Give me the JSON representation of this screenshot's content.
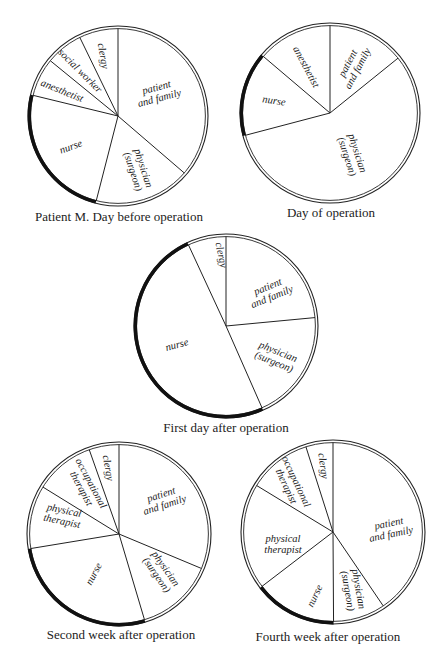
{
  "figure": {
    "highlight_slice": "nurse",
    "colors": {
      "background": "#ffffff",
      "stroke": "#222222",
      "highlight_arc": "#111111"
    }
  },
  "chart_data": [
    {
      "type": "pie",
      "title": "Patient M. Day before operation",
      "center": [
        118,
        116
      ],
      "radius": 90,
      "start_angle_deg": 0,
      "direction": "clockwise",
      "slices": [
        {
          "label": "patient and family",
          "lines": [
            "patient",
            "and family"
          ],
          "pct": 36.3,
          "label_pos": [
            158,
            93
          ],
          "rot": -15
        },
        {
          "label": "physician (surgeon)",
          "lines": [
            "physician",
            "(surgeon)"
          ],
          "pct": 17.7,
          "label_pos": [
            138,
            170
          ],
          "rot": 72
        },
        {
          "label": "nurse",
          "lines": [
            "nurse"
          ],
          "pct": 24.8,
          "label_pos": [
            71,
            147
          ],
          "rot": -20
        },
        {
          "label": "anesthetist",
          "lines": [
            "anesthetist"
          ],
          "pct": 7.1,
          "label_pos": [
            62,
            91
          ],
          "rot": 22
        },
        {
          "label": "social worker",
          "lines": [
            "social worker"
          ],
          "pct": 6.9,
          "label_pos": [
            80,
            71
          ],
          "rot": 45
        },
        {
          "label": "clergy",
          "lines": [
            "clergy"
          ],
          "pct": 7.2,
          "label_pos": [
            103,
            56
          ],
          "rot": 80
        }
      ]
    },
    {
      "type": "pie",
      "title": "Day of operation",
      "center": [
        330,
        113
      ],
      "radius": 90,
      "start_angle_deg": 0,
      "direction": "clockwise",
      "slices": [
        {
          "label": "patient and family",
          "lines": [
            "patient",
            "and family"
          ],
          "pct": 14.2,
          "label_pos": [
            353,
            66
          ],
          "rot": -62
        },
        {
          "label": "physician (surgeon)",
          "lines": [
            "physician",
            "(surgeon)"
          ],
          "pct": 56.7,
          "label_pos": [
            352,
            155
          ],
          "rot": 72
        },
        {
          "label": "nurse",
          "lines": [
            "nurse"
          ],
          "pct": 15.3,
          "label_pos": [
            274,
            101
          ],
          "rot": 8
        },
        {
          "label": "anesthetist",
          "lines": [
            "anesthetist"
          ],
          "pct": 13.8,
          "label_pos": [
            306,
            67
          ],
          "rot": 62
        }
      ]
    },
    {
      "type": "pie",
      "title": "First day after operation",
      "center": [
        226,
        326
      ],
      "radius": 92,
      "start_angle_deg": 0,
      "direction": "clockwise",
      "slices": [
        {
          "label": "patient and family",
          "lines": [
            "patient",
            "and family"
          ],
          "pct": 23.5,
          "label_pos": [
            270,
            292
          ],
          "rot": -22
        },
        {
          "label": "physician (surgeon)",
          "lines": [
            "physician",
            "(surgeon)"
          ],
          "pct": 19.9,
          "label_pos": [
            276,
            357
          ],
          "rot": 22
        },
        {
          "label": "nurse",
          "lines": [
            "nurse"
          ],
          "pct": 49.7,
          "label_pos": [
            177,
            345
          ],
          "rot": -15
        },
        {
          "label": "clergy",
          "lines": [
            "clergy"
          ],
          "pct": 6.9,
          "label_pos": [
            221,
            255
          ],
          "rot": 78
        }
      ]
    },
    {
      "type": "pie",
      "title": "Second week after operation",
      "center": [
        119,
        534
      ],
      "radius": 92,
      "start_angle_deg": 0,
      "direction": "clockwise",
      "slices": [
        {
          "label": "patient and family",
          "lines": [
            "patient",
            "and family"
          ],
          "pct": 31.3,
          "label_pos": [
            163,
            500
          ],
          "rot": -18
        },
        {
          "label": "physician (surgeon)",
          "lines": [
            "physician",
            "(surgeon)"
          ],
          "pct": 14.1,
          "label_pos": [
            161,
            572
          ],
          "rot": 55
        },
        {
          "label": "nurse",
          "lines": [
            "nurse"
          ],
          "pct": 27.0,
          "label_pos": [
            94,
            574
          ],
          "rot": -62
        },
        {
          "label": "physical therapist",
          "lines": [
            "physical",
            "therapist"
          ],
          "pct": 11.4,
          "label_pos": [
            63,
            516
          ],
          "rot": 12
        },
        {
          "label": "occupational therapist",
          "lines": [
            "occupational",
            "therapist"
          ],
          "pct": 10.8,
          "label_pos": [
            86,
            486
          ],
          "rot": 62
        },
        {
          "label": "clergy",
          "lines": [
            "clergy"
          ],
          "pct": 5.5,
          "label_pos": [
            108,
            468
          ],
          "rot": 80
        }
      ]
    },
    {
      "type": "pie",
      "title": "Fourth week after operation",
      "center": [
        333,
        532
      ],
      "radius": 92,
      "start_angle_deg": 0,
      "direction": "clockwise",
      "slices": [
        {
          "label": "patient and family",
          "lines": [
            "patient",
            "and family"
          ],
          "pct": 40.5,
          "label_pos": [
            390,
            529
          ],
          "rot": -12
        },
        {
          "label": "physician (surgeon)",
          "lines": [
            "physician",
            "(surgeon)"
          ],
          "pct": 9.4,
          "label_pos": [
            353,
            590
          ],
          "rot": 80
        },
        {
          "label": "nurse",
          "lines": [
            "nurse"
          ],
          "pct": 14.7,
          "label_pos": [
            315,
            596
          ],
          "rot": -65
        },
        {
          "label": "physical therapist",
          "lines": [
            "physical",
            "therapist"
          ],
          "pct": 19.1,
          "label_pos": [
            283,
            544
          ],
          "rot": 0
        },
        {
          "label": "occupational therapist",
          "lines": [
            "occupational",
            "therapist"
          ],
          "pct": 11.4,
          "label_pos": [
            291,
            484
          ],
          "rot": 65
        },
        {
          "label": "clergy",
          "lines": [
            "clergy"
          ],
          "pct": 4.9,
          "label_pos": [
            323,
            466
          ],
          "rot": 82
        }
      ]
    }
  ],
  "captions": [
    {
      "text": "Patient M. Day before operation",
      "x": 119,
      "y": 209
    },
    {
      "text": "Day of operation",
      "x": 331,
      "y": 205
    },
    {
      "text": "First day after operation",
      "x": 226,
      "y": 420
    },
    {
      "text": "Second week after operation",
      "x": 121,
      "y": 627
    },
    {
      "text": "Fourth week after operation",
      "x": 328,
      "y": 629
    }
  ]
}
